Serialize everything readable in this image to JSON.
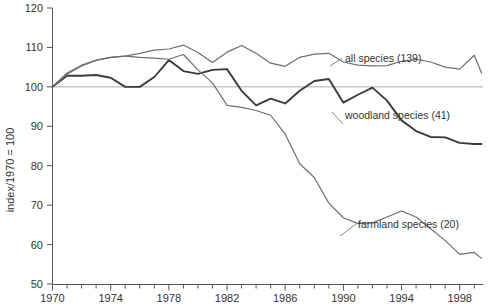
{
  "chart_data": {
    "type": "line",
    "title": "",
    "subtitle": "",
    "xlabel": "",
    "ylabel": "index/1970 = 100",
    "xlim": [
      1970,
      1999.6
    ],
    "ylim": [
      50,
      120
    ],
    "grid": false,
    "reference_line": {
      "value": 100,
      "label": "100",
      "color": "#aaaaaa"
    },
    "legend_position": "inline-annotations",
    "x_tick_labels": [
      "1970",
      "1974",
      "1978",
      "1982",
      "1986",
      "1990",
      "1994",
      "1998"
    ],
    "x_tick_values": [
      1970,
      1974,
      1978,
      1982,
      1986,
      1990,
      1994,
      1998
    ],
    "x_minor_ticks": [
      1970,
      1971,
      1972,
      1973,
      1974,
      1975,
      1976,
      1977,
      1978,
      1979,
      1980,
      1981,
      1982,
      1983,
      1984,
      1985,
      1986,
      1987,
      1988,
      1989,
      1990,
      1991,
      1992,
      1993,
      1994,
      1995,
      1996,
      1997,
      1998,
      1999
    ],
    "y_tick_labels": [
      "50",
      "60",
      "70",
      "80",
      "90",
      "100",
      "110",
      "120"
    ],
    "y_tick_values": [
      50,
      60,
      70,
      80,
      90,
      100,
      110,
      120
    ],
    "x": [
      1970,
      1971,
      1972,
      1973,
      1974,
      1975,
      1976,
      1977,
      1978,
      1979,
      1980,
      1981,
      1982,
      1983,
      1984,
      1985,
      1986,
      1987,
      1988,
      1989,
      1990,
      1991,
      1992,
      1993,
      1994,
      1995,
      1996,
      1997,
      1998,
      1999
    ],
    "series": [
      {
        "name": "all species (139)",
        "label": "all species (139)",
        "count": 139,
        "color": "#6e6e6e",
        "width": 1.2,
        "label_x": 345,
        "label_y": 62,
        "leader": [
          [
            330,
            66
          ],
          [
            342,
            58
          ]
        ],
        "values": [
          100,
          103.5,
          105.5,
          106.8,
          107.5,
          107.8,
          108.5,
          109.3,
          109.6,
          110.6,
          108.7,
          106.2,
          108.8,
          110.5,
          108.5,
          106.0,
          105.2,
          107.5,
          108.3,
          108.5,
          106.3,
          105.5,
          105.3,
          105.4,
          106.5,
          107.0,
          106.3,
          105.0,
          104.5,
          108.0
        ]
      },
      {
        "name": "woodland species (41)",
        "label": "woodland species (41)",
        "count": 41,
        "color": "#3b3b3b",
        "width": 1.9,
        "label_x": 345,
        "label_y": 119,
        "leader": [
          [
            332,
            112
          ],
          [
            343,
            124
          ]
        ],
        "values": [
          100,
          102.8,
          102.8,
          103.0,
          102.3,
          100.0,
          100.0,
          102.5,
          106.8,
          104.0,
          103.3,
          104.3,
          104.5,
          99.0,
          95.3,
          97.0,
          95.8,
          99.0,
          101.5,
          102.0,
          96.0,
          98.0,
          99.8,
          96.5,
          91.5,
          88.8,
          87.3,
          87.2,
          85.8,
          85.5
        ]
      },
      {
        "name": "farmland species (20)",
        "label": "farmland species (20)",
        "count": 20,
        "color": "#6e6e6e",
        "width": 1.2,
        "label_x": 358,
        "label_y": 228,
        "leader": [
          [
            340,
            236
          ],
          [
            356,
            224
          ]
        ],
        "values": [
          100,
          103.2,
          105.3,
          106.7,
          107.5,
          107.8,
          107.5,
          107.3,
          107.0,
          108.2,
          104.3,
          101.0,
          95.3,
          94.8,
          94.0,
          92.8,
          88.0,
          80.5,
          77.0,
          70.5,
          66.8,
          65.3,
          65.5,
          67.0,
          68.5,
          67.0,
          64.0,
          61.0,
          57.5,
          58.0
        ]
      }
    ],
    "series_right_tail": [
      {
        "name": "all species (139)",
        "extra_x": [
          1999.5
        ],
        "extra_values": [
          103.5
        ]
      },
      {
        "name": "woodland species (41)",
        "extra_x": [
          1999.5
        ],
        "extra_values": [
          85.5
        ]
      },
      {
        "name": "farmland species (20)",
        "extra_x": [
          1999.5
        ],
        "extra_values": [
          56.5
        ]
      }
    ],
    "farmland_detail": {
      "x": [
        1990,
        1991,
        1992,
        1993,
        1994,
        1995,
        1996,
        1997,
        1998,
        1999,
        1999.5
      ],
      "values": [
        66.8,
        65.3,
        65.5,
        67.0,
        68.5,
        67.0,
        64.0,
        58.0,
        57.5,
        59.0,
        58.8,
        57.5,
        56.5
      ]
    }
  },
  "axes": {
    "y_axis_title": "index/1970 = 100",
    "axis_color": "#555555",
    "tick_color": "#555555",
    "label_color": "#333333"
  }
}
